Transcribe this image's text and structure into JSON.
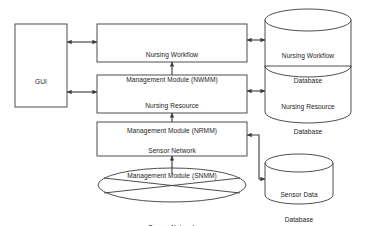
{
  "diagram": {
    "colors": {
      "stroke": "#3a3a3a",
      "text": "#1c1c1c",
      "background": "#ffffff"
    },
    "nodes": {
      "gui": {
        "label": "GUI",
        "shape": "rectangle"
      },
      "nwmm": {
        "line1": "Nursing Workflow",
        "line2": "Management Module (NWMM)",
        "shape": "rectangle"
      },
      "nrmm": {
        "line1": "Nursing Resource",
        "line2": "Management Module (NRMM)",
        "shape": "rectangle"
      },
      "snmm": {
        "line1": "Sensor Network",
        "line2": "Management Module (SNMM)",
        "shape": "rectangle"
      },
      "nursing_workflow_db": {
        "line1": "Nursing Workflow",
        "line2": "Database",
        "shape": "cylinder"
      },
      "nursing_resource_db": {
        "line1": "Nursing Resource",
        "line2": "Database",
        "shape": "cylinder"
      },
      "sensor_data_db": {
        "line1": "Sensor Data",
        "line2": "Database",
        "shape": "cylinder"
      },
      "sensor_network": {
        "label": "Sensor Network",
        "shape": "ellipse-with-cross"
      }
    },
    "connections": [
      {
        "name": "gui-to-nwmm",
        "from": "gui",
        "to": "nwmm",
        "direction": "bidirectional"
      },
      {
        "name": "gui-to-nrmm",
        "from": "gui",
        "to": "nrmm",
        "direction": "bidirectional"
      },
      {
        "name": "nwmm-to-nursing-workflow-db",
        "from": "nwmm",
        "to": "nursing_workflow_db",
        "direction": "bidirectional"
      },
      {
        "name": "nrmm-to-nursing-resource-db",
        "from": "nrmm",
        "to": "nursing_resource_db",
        "direction": "bidirectional"
      },
      {
        "name": "nrmm-to-nwmm",
        "from": "nrmm",
        "to": "nwmm",
        "direction": "up"
      },
      {
        "name": "snmm-to-nrmm",
        "from": "snmm",
        "to": "nrmm",
        "direction": "up"
      },
      {
        "name": "sensor-network-to-snmm",
        "from": "sensor_network",
        "to": "snmm",
        "direction": "up"
      },
      {
        "name": "snmm-to-sensor-data-db",
        "from": "snmm",
        "to": "sensor_data_db",
        "direction": "bidirectional"
      }
    ]
  }
}
